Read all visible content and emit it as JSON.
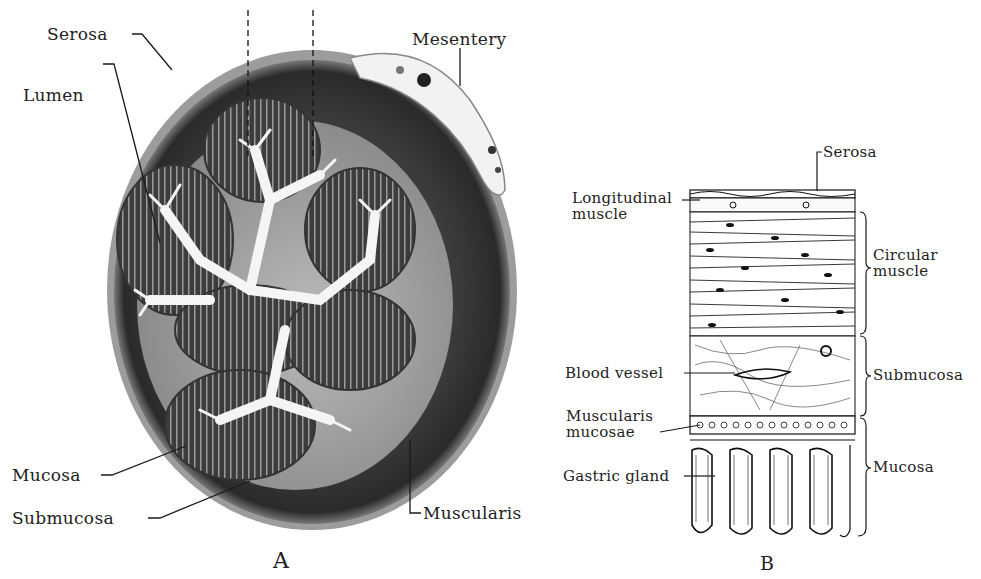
{
  "figure": {
    "panels": [
      {
        "id": "A",
        "letter": "A",
        "description": "Photomicrograph cross-section of stomach/intestinal wall",
        "labels": {
          "serosa": "Serosa",
          "mesentery": "Mesentery",
          "lumen": "Lumen",
          "mucosa": "Mucosa",
          "submucosa": "Submucosa",
          "muscularis": "Muscularis"
        }
      },
      {
        "id": "B",
        "letter": "B",
        "description": "Drawing of wall layers in longitudinal section",
        "labels": {
          "serosa": "Serosa",
          "longitudinal_muscle": "Longitudinal\nmuscle",
          "circular_muscle": "Circular\nmuscle",
          "blood_vessel": "Blood vessel",
          "submucosa": "Submucosa",
          "muscularis_mucosae": "Muscularis\nmucosae",
          "gastric_gland": "Gastric gland",
          "mucosa": "Mucosa"
        }
      }
    ]
  },
  "colors": {
    "ink": "#1a1a1a",
    "muscle_dark": "#2e2e2e",
    "mucosa_mid": "#4a4a4a",
    "submucosa_light": "#9a9a9a",
    "lumen": "#f4f4f4"
  }
}
